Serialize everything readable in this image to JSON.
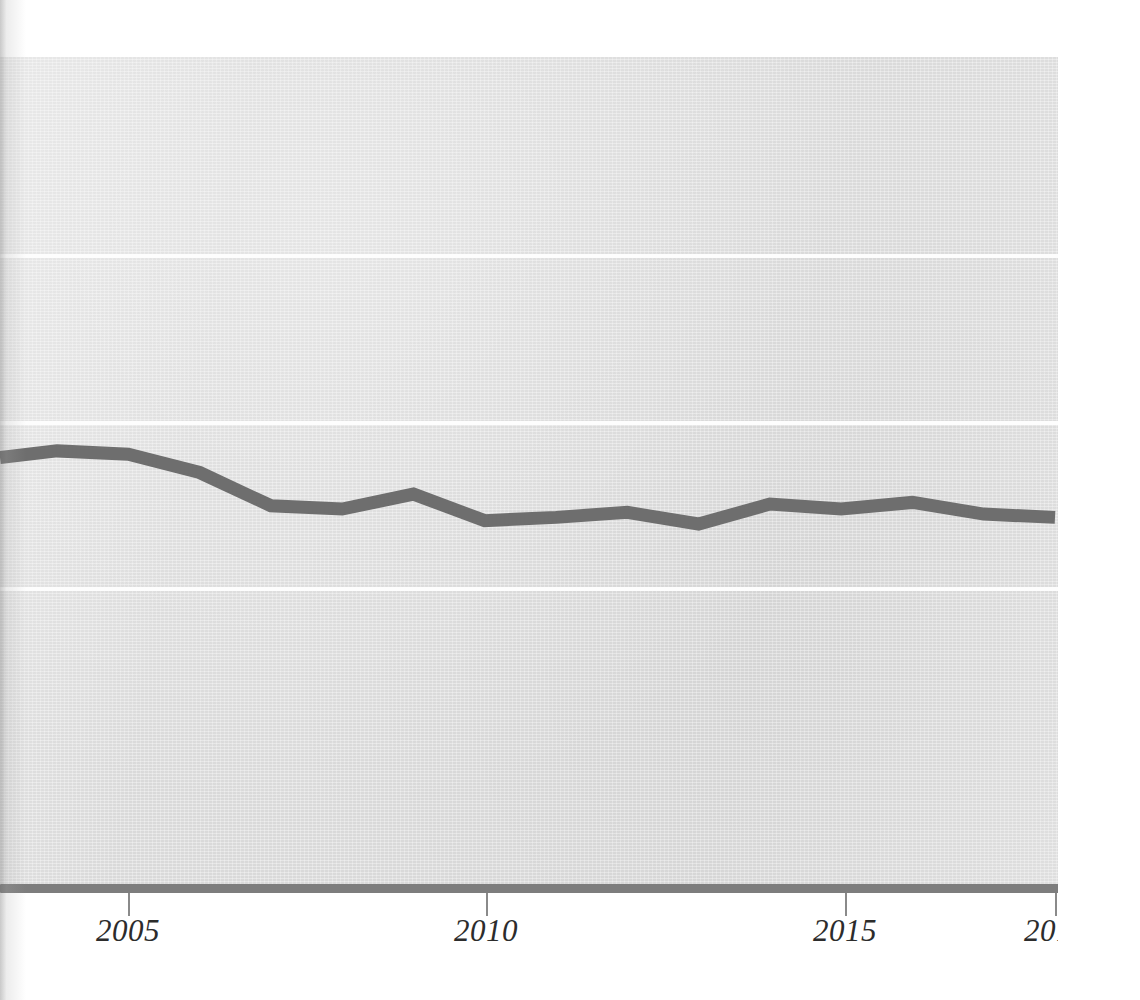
{
  "chart_data": {
    "type": "line",
    "title": "",
    "subtitle": "",
    "xlabel": "",
    "ylabel": "",
    "grid": true,
    "legend": null,
    "legend_position": "none",
    "xlim": [
      2003.2,
      2018
    ],
    "ylim": [
      0,
      5
    ],
    "x_tick_labels": [
      "2005",
      "2010",
      "2015",
      "2018"
    ],
    "x_ticks": [
      2005,
      2010,
      2015,
      2018
    ],
    "y_tick_labels": [],
    "y_gridline_values": [
      3.8,
      2.8,
      1.8
    ],
    "series": [
      {
        "name": "series-1",
        "color": "#6e6e6e",
        "x": [
          2003.2,
          2004,
          2005,
          2006,
          2007,
          2008,
          2009,
          2010,
          2011,
          2012,
          2013,
          2014,
          2015,
          2016,
          2017,
          2018
        ],
        "values": [
          2.59,
          2.63,
          2.61,
          2.5,
          2.3,
          2.28,
          2.37,
          2.21,
          2.23,
          2.26,
          2.19,
          2.31,
          2.28,
          2.32,
          2.25,
          2.23
        ]
      }
    ],
    "annotations": []
  },
  "axis": {
    "x_axis_color": "#7d7d7d",
    "tick_color": "#8a8a8a",
    "tick_label_color": "#2c2c2c"
  },
  "style": {
    "plot_background": "#dfdfdf",
    "page_background": "#ffffff",
    "gridline_color": "#fdfdfd",
    "line_color": "#6e6e6e",
    "line_width_px": 13
  }
}
